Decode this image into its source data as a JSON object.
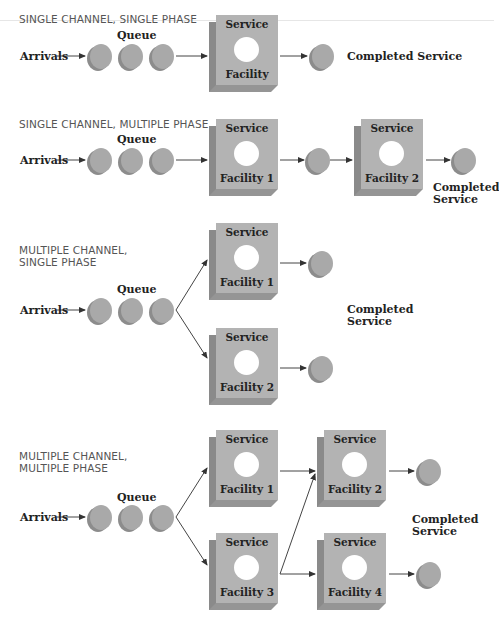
{
  "colors": {
    "box_face": "#b3b3b3",
    "box_side": "#8a8a8a",
    "circle": "#a9a9a9",
    "text": "#222222",
    "title": "#555555"
  },
  "sections": [
    {
      "title": "SINGLE CHANNEL, SINGLE PHASE",
      "arrivals": "Arrivals",
      "queue": "Queue",
      "facilities": [
        {
          "top": "Service",
          "bottom": "Facility"
        }
      ],
      "completed": "Completed Service"
    },
    {
      "title": "SINGLE CHANNEL, MULTIPLE PHASE",
      "arrivals": "Arrivals",
      "queue": "Queue",
      "facilities": [
        {
          "top": "Service",
          "bottom": "Facility 1"
        },
        {
          "top": "Service",
          "bottom": "Facility 2"
        }
      ],
      "completed_line1": "Completed",
      "completed_line2": "Service"
    },
    {
      "title_line1": "MULTIPLE CHANNEL,",
      "title_line2": "SINGLE PHASE",
      "arrivals": "Arrivals",
      "queue": "Queue",
      "facilities": [
        {
          "top": "Service",
          "bottom": "Facility 1"
        },
        {
          "top": "Service",
          "bottom": "Facility 2"
        }
      ],
      "completed_line1": "Completed",
      "completed_line2": "Service"
    },
    {
      "title_line1": "MULTIPLE CHANNEL,",
      "title_line2": "MULTIPLE PHASE",
      "arrivals": "Arrivals",
      "queue": "Queue",
      "facilities": [
        {
          "top": "Service",
          "bottom": "Facility 1"
        },
        {
          "top": "Service",
          "bottom": "Facility 2"
        },
        {
          "top": "Service",
          "bottom": "Facility 3"
        },
        {
          "top": "Service",
          "bottom": "Facility 4"
        }
      ],
      "completed_line1": "Completed",
      "completed_line2": "Service"
    }
  ]
}
